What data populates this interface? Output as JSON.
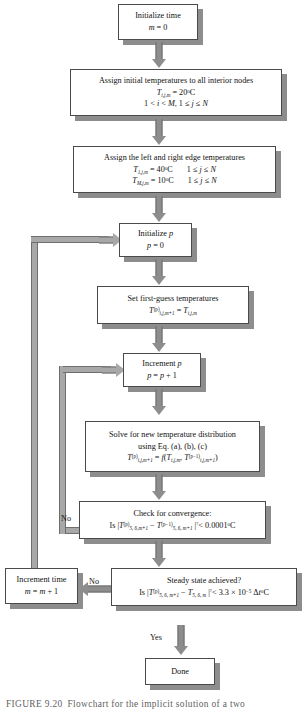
{
  "figure": {
    "caption_number": "FIGURE 9.20",
    "caption_text": "Flowchart for the implicit solution of a two"
  },
  "nodes": {
    "initialize_time": {
      "name": "initialize-time",
      "line1": "Initialize time",
      "line2": "m = 0"
    },
    "assign_initial": {
      "name": "assign-initial-temperatures",
      "line1": "Assign initial temperatures to all interior nodes",
      "line2": "T i,j,m  = 20°C",
      "line3": "1 < i < M, 1 ≤ j ≤ N"
    },
    "assign_edges": {
      "name": "assign-edge-temperatures",
      "line1": "Assign the left and right edge temperatures",
      "line2": "T 1,j,m = 40°C     1 ≤ j ≤ N",
      "line3": "T M,j,m = 10°C     1 ≤ j ≤ N"
    },
    "initialize_p": {
      "name": "initialize-p",
      "line1": "Initialize p",
      "line2": "p = 0"
    },
    "first_guess": {
      "name": "set-first-guess-temperatures",
      "line1": "Set first-guess temperatures",
      "line2": "T(p) i,j,m+1 = T i,j,m"
    },
    "increment_p": {
      "name": "increment-p",
      "line1": "Increment p",
      "line2": "p = p + 1"
    },
    "solve": {
      "name": "solve-temperature-distribution",
      "line1": "Solve for new temperature distribution",
      "line2": "using Eq. (a), (b), (c)",
      "line3": "T(p) i,j,m+1 = f(T i,j,m , T(p-1) i,j,m+1 )"
    },
    "convergence": {
      "name": "check-for-convergence",
      "line1": "Check for convergence:",
      "line2": "Is | T(p) 5,6,m+1 − T(p−1) 5,6,m+1 | <? 0.0001°C"
    },
    "steady_state": {
      "name": "steady-state-check",
      "line1": "Steady state achieved?",
      "line2": "Is | T(p) 5,6,m+1 − T 5,6,m | <? 3.3 × 10⁻⁵ Δt°C"
    },
    "increment_time": {
      "name": "increment-time",
      "line1": "Increment time",
      "line2": "m = m + 1"
    },
    "done": {
      "name": "done",
      "line1": "Done"
    }
  },
  "labels": {
    "convergence_no": "No",
    "steady_no": "No",
    "steady_yes": "Yes"
  },
  "colors": {
    "box_border": "#4a4a4a",
    "box_fill": "#ffffff",
    "shadow": "#8d8d8d",
    "arrow": "#8d8d8d",
    "loop": "#a8a8a8",
    "text": "#111111",
    "caption": "#5f5f5f"
  }
}
